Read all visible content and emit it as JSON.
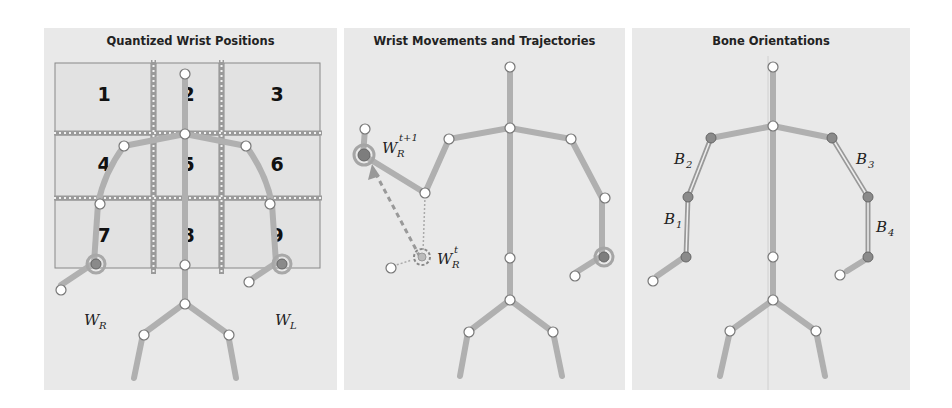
{
  "panels": [
    {
      "title": "Quantized Wrist Positions",
      "grid_cells": [
        "1",
        "2",
        "3",
        "4",
        "5",
        "6",
        "7",
        "8",
        "9"
      ],
      "labels": {
        "right_wrist": "W",
        "right_wrist_sub": "R",
        "left_wrist": "W",
        "left_wrist_sub": "L"
      }
    },
    {
      "title": "Wrist Movements and Trajectories",
      "labels": {
        "wrist_next": "W",
        "wrist_next_sub": "R",
        "wrist_next_sup": "t+1",
        "wrist_curr": "W",
        "wrist_curr_sub": "R",
        "wrist_curr_sup": "t"
      }
    },
    {
      "title": "Bone Orientations",
      "labels": {
        "b1": "B",
        "b1_sub": "1",
        "b2": "B",
        "b2_sub": "2",
        "b3": "B",
        "b3_sub": "3",
        "b4": "B",
        "b4_sub": "4"
      }
    }
  ],
  "colors": {
    "panel_bg": "#e9e9e9",
    "bone": "#b5b5b5",
    "joint_fill": "#ffffff",
    "joint_stroke": "#777777",
    "highlight_joint": "#8a8a8a",
    "grid_line": "#888888"
  }
}
